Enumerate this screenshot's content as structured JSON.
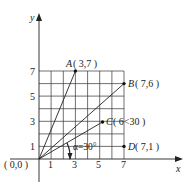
{
  "diagram": {
    "axes": {
      "x_label": "x",
      "y_label": "y"
    },
    "origin_label": "( 0,0 )",
    "x_ticks": [
      "1",
      "3",
      "5",
      "7"
    ],
    "y_ticks": [
      "1",
      "3",
      "5",
      "7"
    ],
    "points": [
      {
        "name": "A",
        "coords": "( 3,7 )"
      },
      {
        "name": "B",
        "coords": "( 7,6 )"
      },
      {
        "name": "C",
        "coords": "( 6<30 )"
      },
      {
        "name": "D",
        "coords": "( 7,1 )"
      }
    ],
    "angle_label": "α=30°",
    "colors": {
      "line": "#222222",
      "grid": "#333333"
    }
  }
}
